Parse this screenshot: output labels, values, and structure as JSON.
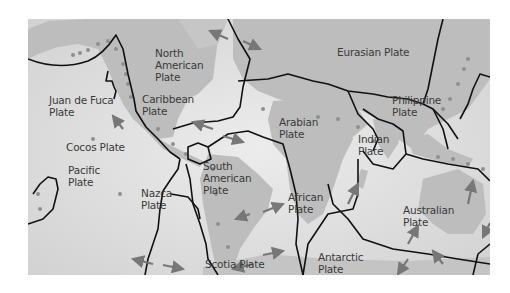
{
  "figure": {
    "type": "world map of tectonic plates",
    "colors": {
      "ocean": "#dcdcdc",
      "land": "#b8b8b8",
      "boundary": "#111111",
      "arrow": "#777777",
      "dots": "#8f8f8f",
      "label": "#3a3a3a"
    }
  },
  "plates": [
    {
      "id": "north-american",
      "label": "North\nAmerican\nPlate"
    },
    {
      "id": "eurasian",
      "label": "Eurasian Plate"
    },
    {
      "id": "juan-de-fuca",
      "label": "Juan de Fuca\nPlate"
    },
    {
      "id": "caribbean",
      "label": "Caribbean\nPlate"
    },
    {
      "id": "philippine",
      "label": "Philippine\nPlate"
    },
    {
      "id": "arabian",
      "label": "Arabian\nPlate"
    },
    {
      "id": "indian",
      "label": "Indian\nPlate"
    },
    {
      "id": "cocos",
      "label": "Cocos Plate"
    },
    {
      "id": "pacific",
      "label": "Pacific\nPlate"
    },
    {
      "id": "south-american",
      "label": "South\nAmerican\nPlate"
    },
    {
      "id": "nazca",
      "label": "Nazca\nPlate"
    },
    {
      "id": "african",
      "label": "African\nPlate"
    },
    {
      "id": "australian",
      "label": "Australian\nPlate"
    },
    {
      "id": "scotia",
      "label": "Scotia Plate"
    },
    {
      "id": "antarctic",
      "label": "Antarctic\nPlate"
    }
  ]
}
